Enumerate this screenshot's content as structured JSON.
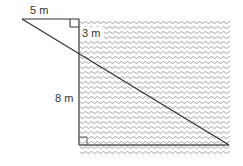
{
  "diagram": {
    "type": "geometry-similar-triangles",
    "labels": {
      "top_length": "5 m",
      "short_vertical": "3 m",
      "depth": "8 m"
    },
    "colors": {
      "line": "#333333",
      "water_wave": "#8a8a8a",
      "background": "#ffffff"
    },
    "points": {
      "observer_eye": [
        22,
        19
      ],
      "edge_top": [
        79,
        19
      ],
      "edge_bottom": [
        79,
        145
      ],
      "far_bottom": [
        229,
        145
      ]
    },
    "water_region": {
      "x": 79,
      "y": 20,
      "width": 151,
      "height": 135
    }
  }
}
